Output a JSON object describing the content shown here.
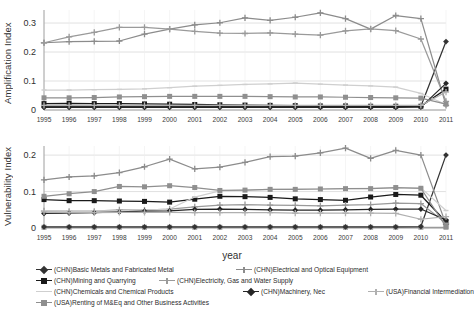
{
  "axis": {
    "xlabel": "year",
    "top_ylabel": "Amplification Index",
    "bottom_ylabel": "Vulnerability Index",
    "top_yticks": [
      "0",
      "0.1",
      "0.2",
      "0.3"
    ],
    "bottom_yticks": [
      "0",
      "0.1",
      "0.2"
    ],
    "xticks": [
      "1995",
      "1996",
      "1997",
      "1998",
      "1999",
      "2000",
      "2001",
      "2002",
      "2003",
      "2004",
      "2005",
      "2006",
      "2007",
      "2008",
      "2009",
      "2010",
      "2011"
    ]
  },
  "colors": {
    "basic_metals": "#333333",
    "electrical_optical": "#8c8c8c",
    "mining_quarrying": "#1a1a1a",
    "electricity_gas_water": "#9a9a9a",
    "chemicals": "#cfcfcf",
    "machinery_nec": "#262626",
    "usa_financial": "#b0b0b0",
    "usa_renting": "#8f8f8f",
    "grid": "#d9d9d9",
    "axis": "#9a9a9a",
    "text": "#2f2f2f"
  },
  "legend": {
    "rows": [
      [
        {
          "label": "(CHN)Basic Metals and Fabricated Metal",
          "marker": "diamond",
          "color_key": "basic_metals"
        },
        {
          "label": "(CHN)Electrical and Optical Equipment",
          "marker": "plus",
          "color_key": "electrical_optical"
        }
      ],
      [
        {
          "label": "(CHN)Mining and Quarrying",
          "marker": "square",
          "color_key": "mining_quarrying"
        },
        {
          "label": "(CHN)Electricity, Gas and Water Supply",
          "marker": "plus",
          "color_key": "electricity_gas_water"
        }
      ],
      [
        {
          "label": "(CHN)Chemicals and Chemical Products",
          "marker": "line",
          "color_key": "chemicals"
        },
        {
          "label": "(CHN)Machinery, Nec",
          "marker": "diamond",
          "color_key": "machinery_nec"
        },
        {
          "label": "(USA)Financial Intermediation",
          "marker": "plus",
          "color_key": "usa_financial"
        }
      ],
      [
        {
          "label": "(USA)Renting of M&Eq and Other Business Activities",
          "marker": "square",
          "color_key": "usa_renting"
        }
      ]
    ]
  },
  "chart_data": [
    {
      "type": "line",
      "title": "",
      "xlabel": "year",
      "ylabel": "Amplification Index",
      "x": [
        1995,
        1996,
        1997,
        1998,
        1999,
        2000,
        2001,
        2002,
        2003,
        2004,
        2005,
        2006,
        2007,
        2008,
        2009,
        2010,
        2011
      ],
      "xlim": [
        1995,
        2011
      ],
      "ylim": [
        0,
        0.345
      ],
      "yticks": [
        0,
        0.1,
        0.2,
        0.3
      ],
      "grid": true,
      "legend_position": "below-figure",
      "series": [
        {
          "name": "(CHN)Basic Metals and Fabricated Metal",
          "marker": "diamond",
          "color": "#333333",
          "values": [
            0.012,
            0.012,
            0.012,
            0.012,
            0.012,
            0.012,
            0.012,
            0.012,
            0.012,
            0.012,
            0.012,
            0.012,
            0.012,
            0.012,
            0.012,
            0.013,
            0.236
          ]
        },
        {
          "name": "(CHN)Electrical and Optical Equipment",
          "marker": "plus",
          "color": "#8c8c8c",
          "values": [
            0.232,
            0.236,
            0.237,
            0.238,
            0.262,
            0.279,
            0.294,
            0.301,
            0.318,
            0.309,
            0.32,
            0.335,
            0.315,
            0.279,
            0.326,
            0.315,
            0.016
          ]
        },
        {
          "name": "(CHN)Mining and Quarrying",
          "marker": "square",
          "color": "#1a1a1a",
          "values": [
            0.022,
            0.023,
            0.022,
            0.022,
            0.021,
            0.02,
            0.019,
            0.018,
            0.017,
            0.016,
            0.015,
            0.014,
            0.014,
            0.013,
            0.013,
            0.013,
            0.072
          ]
        },
        {
          "name": "(CHN)Electricity, Gas and Water Supply",
          "marker": "plus",
          "color": "#9a9a9a",
          "values": [
            0.232,
            0.252,
            0.268,
            0.285,
            0.285,
            0.279,
            0.271,
            0.265,
            0.264,
            0.266,
            0.262,
            0.258,
            0.273,
            0.28,
            0.274,
            0.245,
            0.03
          ]
        },
        {
          "name": "(CHN)Chemicals and Chemical Products",
          "marker": "line",
          "color": "#cfcfcf",
          "values": [
            0.069,
            0.069,
            0.07,
            0.071,
            0.073,
            0.077,
            0.082,
            0.085,
            0.088,
            0.09,
            0.093,
            0.089,
            0.086,
            0.083,
            0.079,
            0.057,
            0.019
          ]
        },
        {
          "name": "(CHN)Machinery, Nec",
          "marker": "diamond",
          "color": "#262626",
          "values": [
            0.009,
            0.009,
            0.009,
            0.009,
            0.009,
            0.009,
            0.009,
            0.009,
            0.009,
            0.009,
            0.009,
            0.009,
            0.009,
            0.009,
            0.009,
            0.01,
            0.092
          ]
        },
        {
          "name": "(USA)Financial Intermediation",
          "marker": "plus",
          "color": "#b0b0b0",
          "values": [
            0.016,
            0.016,
            0.016,
            0.016,
            0.016,
            0.016,
            0.016,
            0.016,
            0.016,
            0.016,
            0.016,
            0.016,
            0.016,
            0.016,
            0.016,
            0.016,
            0.062
          ]
        },
        {
          "name": "(USA)Renting of M&Eq and Other Business Activities",
          "marker": "square",
          "color": "#8f8f8f",
          "values": [
            0.042,
            0.042,
            0.043,
            0.045,
            0.046,
            0.047,
            0.047,
            0.047,
            0.047,
            0.046,
            0.045,
            0.045,
            0.044,
            0.043,
            0.042,
            0.041,
            0.02
          ]
        }
      ]
    },
    {
      "type": "line",
      "title": "",
      "xlabel": "year",
      "ylabel": "Vulnerability Index",
      "x": [
        1995,
        1996,
        1997,
        1998,
        1999,
        2000,
        2001,
        2002,
        2003,
        2004,
        2005,
        2006,
        2007,
        2008,
        2009,
        2010,
        2011
      ],
      "xlim": [
        1995,
        2011
      ],
      "ylim": [
        0,
        0.225
      ],
      "yticks": [
        0,
        0.1,
        0.2
      ],
      "grid": true,
      "legend_position": "below-figure",
      "series": [
        {
          "name": "(CHN)Basic Metals and Fabricated Metal",
          "marker": "diamond",
          "color": "#333333",
          "values": [
            0.003,
            0.003,
            0.003,
            0.003,
            0.003,
            0.003,
            0.003,
            0.003,
            0.003,
            0.003,
            0.003,
            0.003,
            0.003,
            0.003,
            0.003,
            0.004,
            0.2
          ]
        },
        {
          "name": "(CHN)Electrical and Optical Equipment",
          "marker": "plus",
          "color": "#8c8c8c",
          "values": [
            0.132,
            0.14,
            0.143,
            0.152,
            0.168,
            0.189,
            0.162,
            0.167,
            0.18,
            0.196,
            0.197,
            0.206,
            0.219,
            0.191,
            0.213,
            0.2,
            0.01
          ]
        },
        {
          "name": "(CHN)Mining and Quarrying",
          "marker": "square",
          "color": "#1a1a1a",
          "values": [
            0.078,
            0.075,
            0.075,
            0.074,
            0.073,
            0.071,
            0.079,
            0.087,
            0.086,
            0.084,
            0.08,
            0.078,
            0.076,
            0.085,
            0.092,
            0.09,
            0.017
          ]
        },
        {
          "name": "(CHN)Electricity, Gas and Water Supply",
          "marker": "plus",
          "color": "#9a9a9a",
          "values": [
            0.047,
            0.046,
            0.046,
            0.05,
            0.049,
            0.052,
            0.058,
            0.063,
            0.064,
            0.063,
            0.062,
            0.061,
            0.063,
            0.064,
            0.068,
            0.067,
            0.013
          ]
        },
        {
          "name": "(CHN)Chemicals and Chemical Products",
          "marker": "line",
          "color": "#cfcfcf",
          "values": [
            0.047,
            0.046,
            0.046,
            0.048,
            0.049,
            0.052,
            0.085,
            0.102,
            0.104,
            0.106,
            0.107,
            0.107,
            0.108,
            0.109,
            0.11,
            0.11,
            0.048
          ]
        },
        {
          "name": "(CHN)Machinery, Nec",
          "marker": "diamond",
          "color": "#262626",
          "values": [
            0.04,
            0.041,
            0.042,
            0.044,
            0.046,
            0.047,
            0.051,
            0.052,
            0.051,
            0.05,
            0.049,
            0.049,
            0.05,
            0.051,
            0.052,
            0.052,
            0.022
          ]
        },
        {
          "name": "(USA)Financial Intermediation",
          "marker": "plus",
          "color": "#b0b0b0",
          "values": [
            0.044,
            0.042,
            0.042,
            0.043,
            0.043,
            0.043,
            0.042,
            0.042,
            0.042,
            0.042,
            0.041,
            0.041,
            0.041,
            0.041,
            0.04,
            0.024,
            0.031
          ]
        },
        {
          "name": "(USA)Renting of M&Eq and Other Business Activities",
          "marker": "square",
          "color": "#8f8f8f",
          "values": [
            0.087,
            0.094,
            0.1,
            0.114,
            0.113,
            0.116,
            0.111,
            0.103,
            0.104,
            0.106,
            0.106,
            0.107,
            0.108,
            0.108,
            0.111,
            0.109,
            0.004
          ]
        }
      ]
    },
    {
      "type": "line",
      "note": "zero-baseline series (bottom panel)",
      "series": [
        {
          "name": "baseline",
          "marker": "square",
          "color": "#9a9a9a",
          "values": [
            0.002,
            0.002,
            0.002,
            0.002,
            0.002,
            0.002,
            0.002,
            0.002,
            0.002,
            0.002,
            0.002,
            0.002,
            0.002,
            0.002,
            0.002,
            0.002,
            0.002
          ]
        }
      ]
    }
  ]
}
